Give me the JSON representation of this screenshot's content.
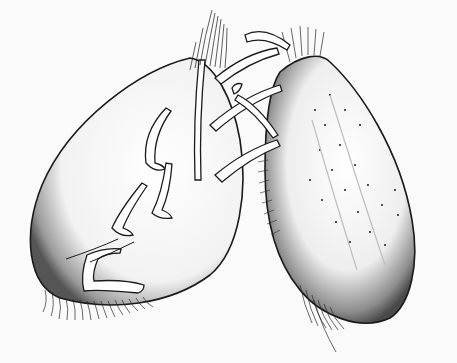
{
  "image": {
    "type": "scientific-illustration",
    "style": "pen-and-ink stippled line drawing",
    "subject": "two oval appendage lobes with hooked spines and setae fringes",
    "width": 457,
    "height": 363,
    "colors": {
      "background": "#fafafa",
      "ink": "#1a1a1a",
      "shade": "#8a8a8a",
      "paper": "#ffffff"
    }
  }
}
